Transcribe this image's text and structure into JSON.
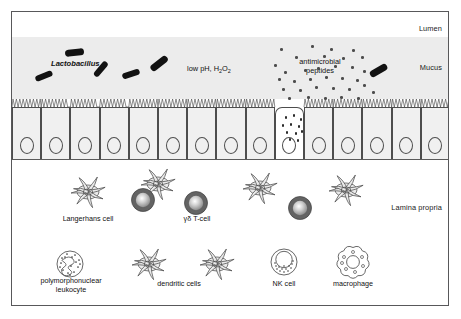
{
  "figure": {
    "colors": {
      "mucus_band": "#ececec",
      "epithelial_cell": "#f0f0f0",
      "outline": "#4d4d4d",
      "bacteria": "#121212",
      "peptide_dot": "#4c4c4c",
      "tcell_dark": "#636363",
      "dendritic_fill": "#eaeaea",
      "frame_border": "#58585a",
      "background": "#ffffff"
    }
  },
  "regions": [
    {
      "id": "lumen",
      "label": "Lumen"
    },
    {
      "id": "mucus",
      "label": "Mucus"
    },
    {
      "id": "epithelium",
      "label": "Epithelium"
    },
    {
      "id": "lamina_propria",
      "label": "Lamina propria"
    }
  ],
  "mucus_annotations": {
    "lactobacillus": "Lactobacillus",
    "low_ph_prefix": "low pH, H",
    "low_ph_sub1": "2",
    "low_ph_mid": "O",
    "low_ph_sub2": "2",
    "antimicrobial_line1": "antimicrobial",
    "antimicrobial_line2": "peptides"
  },
  "bacteria": [
    {
      "x": 23,
      "y": 61,
      "w": 18,
      "h": 6.4,
      "rot": -22
    },
    {
      "x": 53,
      "y": 37,
      "w": 19,
      "h": 6.6,
      "rot": -6
    },
    {
      "x": 80,
      "y": 54,
      "w": 18,
      "h": 6.4,
      "rot": -50
    },
    {
      "x": 110,
      "y": 59,
      "w": 18,
      "h": 6.2,
      "rot": -18
    },
    {
      "x": 137,
      "y": 48,
      "w": 20,
      "h": 6.6,
      "rot": -38
    },
    {
      "x": 357,
      "y": 55,
      "w": 19,
      "h": 6.6,
      "rot": -30
    }
  ],
  "peptide_dots": [
    {
      "x": 268,
      "y": 36
    },
    {
      "x": 299,
      "y": 33
    },
    {
      "x": 318,
      "y": 36
    },
    {
      "x": 340,
      "y": 37
    },
    {
      "x": 283,
      "y": 44
    },
    {
      "x": 311,
      "y": 43
    },
    {
      "x": 330,
      "y": 45
    },
    {
      "x": 349,
      "y": 44
    },
    {
      "x": 262,
      "y": 52
    },
    {
      "x": 272,
      "y": 59
    },
    {
      "x": 292,
      "y": 57
    },
    {
      "x": 305,
      "y": 55
    },
    {
      "x": 322,
      "y": 53
    },
    {
      "x": 339,
      "y": 54
    },
    {
      "x": 351,
      "y": 58
    },
    {
      "x": 266,
      "y": 66
    },
    {
      "x": 281,
      "y": 68
    },
    {
      "x": 297,
      "y": 66
    },
    {
      "x": 313,
      "y": 64
    },
    {
      "x": 329,
      "y": 65
    },
    {
      "x": 344,
      "y": 67
    },
    {
      "x": 270,
      "y": 76
    },
    {
      "x": 287,
      "y": 77
    },
    {
      "x": 303,
      "y": 74
    },
    {
      "x": 320,
      "y": 75
    },
    {
      "x": 336,
      "y": 76
    },
    {
      "x": 351,
      "y": 72
    },
    {
      "x": 360,
      "y": 79
    },
    {
      "x": 276,
      "y": 85
    },
    {
      "x": 295,
      "y": 84
    },
    {
      "x": 312,
      "y": 85
    },
    {
      "x": 328,
      "y": 84
    },
    {
      "x": 345,
      "y": 85
    }
  ],
  "epithelial_cells": {
    "count": 15,
    "secretory_index": 9,
    "secretory_granules": [
      {
        "x": 9,
        "y": 8
      },
      {
        "x": 17,
        "y": 6
      },
      {
        "x": 24,
        "y": 10
      },
      {
        "x": 6,
        "y": 16
      },
      {
        "x": 14,
        "y": 15
      },
      {
        "x": 22,
        "y": 17
      },
      {
        "x": 10,
        "y": 23
      },
      {
        "x": 19,
        "y": 24
      },
      {
        "x": 25,
        "y": 22
      },
      {
        "x": 13,
        "y": 30
      },
      {
        "x": 21,
        "y": 31
      }
    ]
  },
  "immune_cells": [
    {
      "name": "langerhans-cell",
      "label": "Langerhans cell",
      "type": "dendritic",
      "cx": 76,
      "cy": 180,
      "label_x": 76,
      "label_y": 207
    },
    {
      "name": "gamma-delta-t-cell",
      "label": "γδ T-cell",
      "type": "tcell",
      "cx": 184,
      "cy": 191,
      "label_x": 184,
      "label_y": 207
    },
    {
      "name": "intraepithelial-dendritic-cell",
      "label": "",
      "type": "dendritic",
      "cx": 146,
      "cy": 172,
      "label_x": 0,
      "label_y": 0
    },
    {
      "name": "lamina-t-cell-left",
      "label": "",
      "type": "tcell",
      "cx": 131,
      "cy": 188,
      "label_x": 0,
      "label_y": 0
    },
    {
      "name": "lamina-dendritic-cell-mid",
      "label": "",
      "type": "dendritic",
      "cx": 248,
      "cy": 176,
      "label_x": 0,
      "label_y": 0
    },
    {
      "name": "lamina-t-cell-right",
      "label": "",
      "type": "tcell",
      "cx": 288,
      "cy": 196,
      "label_x": 0,
      "label_y": 0
    },
    {
      "name": "lamina-dendritic-cell-right",
      "label": "",
      "type": "dendritic",
      "cx": 334,
      "cy": 178,
      "label_x": 0,
      "label_y": 0
    },
    {
      "name": "polymorphonuclear-leukocyte",
      "label": "polymorphonuclear\nleukocyte",
      "type": "pmn",
      "cx": 58,
      "cy": 252,
      "label_x": 58,
      "label_y": 272
    },
    {
      "name": "dendritic-cells",
      "label": "dendritic cells",
      "type": "dendritic",
      "cx": 137,
      "cy": 252,
      "label_x": 167,
      "label_y": 274
    },
    {
      "name": "dendritic-cell-second",
      "label": "",
      "type": "dendritic",
      "cx": 205,
      "cy": 252,
      "label_x": 0,
      "label_y": 0
    },
    {
      "name": "nk-cell",
      "label": "NK cell",
      "type": "nk",
      "cx": 272,
      "cy": 250,
      "label_x": 272,
      "label_y": 273
    },
    {
      "name": "macrophage",
      "label": "macrophage",
      "type": "macrophage",
      "cx": 341,
      "cy": 250,
      "label_x": 341,
      "label_y": 273
    }
  ],
  "bottom_labels": {
    "pmn_line1": "polymorphonuclear",
    "pmn_line2": "leukocyte",
    "dendritic": "dendritic cells",
    "nk": "NK cell",
    "macrophage": "macrophage"
  }
}
